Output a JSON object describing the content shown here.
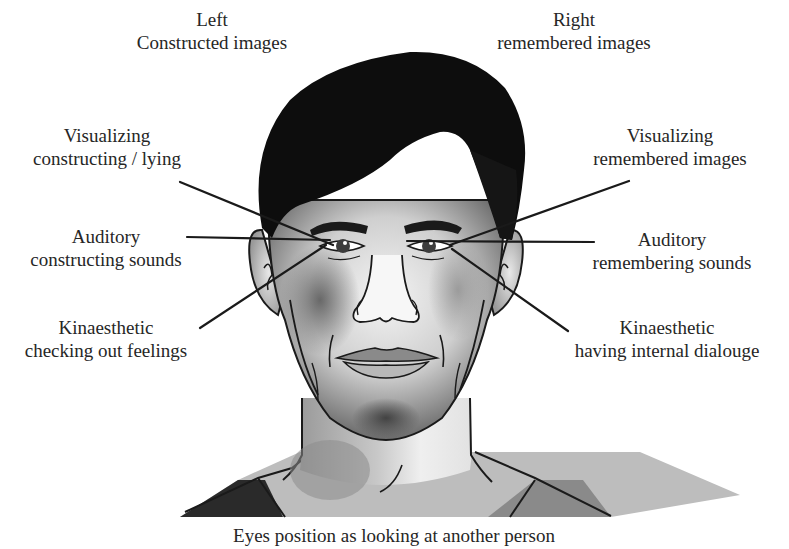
{
  "diagram": {
    "title_left": {
      "line1": "Left",
      "line2": "Constructed images",
      "x": 212,
      "y": 8
    },
    "title_right": {
      "line1": "Right",
      "line2": "remembered images",
      "x": 574,
      "y": 8
    },
    "labels": [
      {
        "id": "visual-constructing",
        "line1": "Visualizing",
        "line2": "constructing / lying",
        "x": 107,
        "y": 124,
        "side": "left"
      },
      {
        "id": "visual-remembered",
        "line1": "Visualizing",
        "line2": "remembered images",
        "x": 670,
        "y": 124,
        "side": "right"
      },
      {
        "id": "auditory-constructing",
        "line1": "Auditory",
        "line2": "constructing sounds",
        "x": 106,
        "y": 225,
        "side": "left"
      },
      {
        "id": "auditory-remembering",
        "line1": "Auditory",
        "line2": "remembering sounds",
        "x": 672,
        "y": 228,
        "side": "right"
      },
      {
        "id": "kinaesthetic-feelings",
        "line1": "Kinaesthetic",
        "line2": "checking out feelings",
        "x": 106,
        "y": 316,
        "side": "left"
      },
      {
        "id": "kinaesthetic-dialogue",
        "line1": "Kinaesthetic",
        "line2": "having internal dialouge",
        "x": 667,
        "y": 316,
        "side": "right"
      }
    ],
    "pointer_lines": [
      {
        "id": "visual-constructing",
        "x1": 180,
        "y1": 182,
        "x2": 333,
        "y2": 245
      },
      {
        "id": "visual-remembered",
        "x1": 629,
        "y1": 181,
        "x2": 450,
        "y2": 245
      },
      {
        "id": "auditory-constructing",
        "x1": 187,
        "y1": 237,
        "x2": 330,
        "y2": 240
      },
      {
        "id": "auditory-remembering",
        "x1": 594,
        "y1": 242,
        "x2": 407,
        "y2": 241
      },
      {
        "id": "kinaesthetic-feelings",
        "x1": 200,
        "y1": 328,
        "x2": 326,
        "y2": 245
      },
      {
        "id": "kinaesthetic-dialogue",
        "x1": 568,
        "y1": 331,
        "x2": 452,
        "y2": 249
      }
    ],
    "caption": "Eyes position as looking at another person",
    "colors": {
      "background": "#ffffff",
      "text": "#262626",
      "line": "#1a1a1a",
      "hair": "#0d0d0d",
      "skin_light": "#f2f2f2",
      "skin_shadow": "#6e6e6e",
      "shirt_dark": "#2a2a2a",
      "shirt_mid": "#8a8a8a"
    }
  }
}
